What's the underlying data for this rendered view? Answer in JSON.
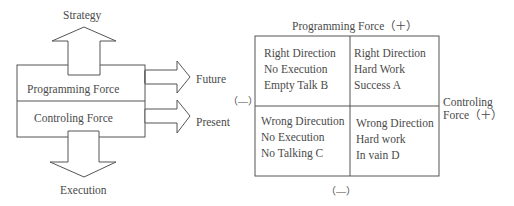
{
  "left_diagram": {
    "top_arrow_label": "Strategy",
    "bottom_arrow_label": "Execution",
    "upper_box_label": "Programming Force",
    "lower_box_label": "Controling Force",
    "right_arrow_upper_label": "Future",
    "right_arrow_lower_label": "Present"
  },
  "matrix": {
    "top_axis_label": "Programming Force（＋）",
    "bottom_axis_label": "（—）",
    "left_axis_label": "（—）",
    "right_axis_label_line1": "Controling",
    "right_axis_label_line2": "Force（＋）",
    "quadrants": {
      "top_left": [
        "Right Direction",
        "No Execution",
        "Empty Talk B"
      ],
      "top_right": [
        "Right Direction",
        "Hard Work",
        "Success A"
      ],
      "bottom_left": [
        "Wrong Direcution",
        "No Execution",
        "No Talking C"
      ],
      "bottom_right": [
        "Wrong Direction",
        "Hard work",
        "In vain D"
      ]
    }
  },
  "colors": {
    "stroke": "#555555",
    "text": "#4a4a4a"
  }
}
